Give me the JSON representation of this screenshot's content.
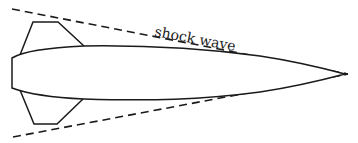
{
  "diagram": {
    "title": "",
    "labels": {
      "shock_wave": "shock wave"
    },
    "colors": {
      "line": "#1a1a1a",
      "background": "#ffffff",
      "text": "#222222"
    },
    "elements": [
      {
        "id": "body",
        "type": "projectile-outline",
        "description": "streamlined body with blunt rear and pointed nose at right"
      },
      {
        "id": "fin-top",
        "type": "fin"
      },
      {
        "id": "fin-bottom",
        "type": "fin"
      },
      {
        "id": "shock-wave-upper",
        "type": "dashed-line"
      },
      {
        "id": "shock-wave-lower",
        "type": "dashed-line"
      }
    ]
  }
}
